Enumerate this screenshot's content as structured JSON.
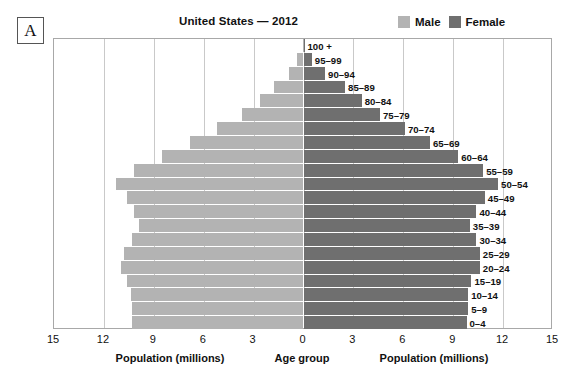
{
  "panel": {
    "letter": "A"
  },
  "title": "United States — 2012",
  "legend": {
    "position": "top-right",
    "items": [
      {
        "label": "Male",
        "color": "#b3b3b3",
        "swatch": "male-swatch"
      },
      {
        "label": "Female",
        "color": "#6f6f6f",
        "swatch": "female-swatch"
      }
    ]
  },
  "axis": {
    "left_caption": "Population (millions)",
    "center_caption": "Age group",
    "right_caption": "Population (millions)",
    "ticks": [
      "15",
      "12",
      "9",
      "6",
      "3",
      "0",
      "3",
      "6",
      "9",
      "12",
      "15"
    ]
  },
  "chart_data": {
    "type": "bar",
    "subtype": "population-pyramid",
    "title": "United States — 2012",
    "xlabel": "Population (millions)",
    "ylabel": "Age group",
    "xlim": [
      -15,
      15
    ],
    "xticks": [
      15,
      12,
      9,
      6,
      3,
      0,
      3,
      6,
      9,
      12,
      15
    ],
    "grid": true,
    "legend": [
      "Male",
      "Female"
    ],
    "categories": [
      "100 +",
      "95–99",
      "90–94",
      "85–89",
      "80–84",
      "75–79",
      "70–74",
      "65–69",
      "60–64",
      "55–59",
      "50–54",
      "45–49",
      "40–44",
      "35–39",
      "30–34",
      "25–29",
      "20–24",
      "15–19",
      "10–14",
      "5–9",
      "0–4"
    ],
    "series": [
      {
        "name": "Male",
        "color": "#b3b3b3",
        "side": "left",
        "values": [
          0.06,
          0.4,
          0.9,
          1.8,
          2.6,
          3.7,
          5.2,
          6.8,
          8.5,
          10.2,
          11.3,
          10.6,
          10.2,
          9.9,
          10.3,
          10.8,
          11.0,
          10.6,
          10.4,
          10.3,
          10.3
        ]
      },
      {
        "name": "Female",
        "color": "#6f6f6f",
        "side": "right",
        "values": [
          0.06,
          0.5,
          1.3,
          2.5,
          3.5,
          4.6,
          6.1,
          7.6,
          9.3,
          10.8,
          11.7,
          10.9,
          10.4,
          10.0,
          10.4,
          10.6,
          10.6,
          10.1,
          9.9,
          9.9,
          9.8
        ]
      }
    ]
  }
}
